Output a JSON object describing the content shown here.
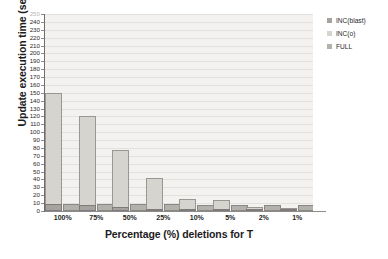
{
  "chart_data": {
    "type": "bar",
    "title": "",
    "xlabel": "Percentage (%) deletions for T",
    "ylabel": "Update execution time (sec)",
    "categories": [
      "100%",
      "75%",
      "50%",
      "25%",
      "10%",
      "5%",
      "2%",
      "1%"
    ],
    "series": [
      {
        "name": "INC(blast)",
        "color": "#a5a2a0",
        "values": [
          9,
          8,
          5,
          3,
          2,
          2,
          2,
          2
        ]
      },
      {
        "name": "INC(o)",
        "color": "#d6d4cf",
        "values": [
          150,
          120,
          78,
          42,
          15,
          14,
          5,
          4
        ]
      },
      {
        "name": "FULL",
        "color": "#b3b1ac",
        "values": [
          9,
          9,
          9,
          9,
          8,
          8,
          8,
          8
        ]
      }
    ],
    "ylim": [
      0,
      250
    ],
    "ytick_step": 10,
    "ytick_labels": [
      "250",
      "240",
      "230",
      "220",
      "210",
      "200",
      "190",
      "180",
      "170",
      "160",
      "150",
      "140",
      "130",
      "120",
      "110",
      "100",
      "90",
      "80",
      "70",
      "60",
      "50",
      "40",
      "30",
      "20",
      "10",
      "0"
    ],
    "grid": true,
    "grid_axis": "y",
    "legend_position": "right",
    "plot_background": "#f3f2f0",
    "legend_entries": [
      "INC(blast)",
      "INC(o)",
      "FULL"
    ]
  }
}
